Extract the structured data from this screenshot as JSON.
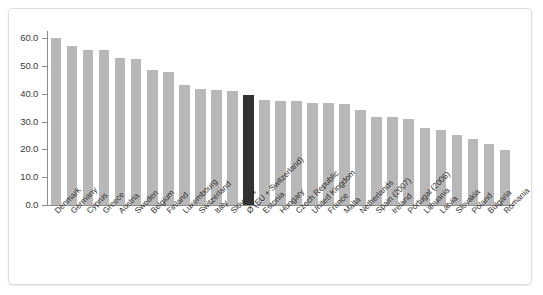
{
  "chart_data": {
    "type": "bar",
    "title": "",
    "subtitle": "",
    "xlabel": "",
    "ylabel": "",
    "ylim": [
      0,
      60
    ],
    "ytick_labels": [
      "60.0",
      "50.0",
      "40.0",
      "30.0",
      "20.0",
      "10.0",
      "0.0"
    ],
    "ytick_values": [
      60,
      50,
      40,
      30,
      20,
      10,
      0
    ],
    "grid": false,
    "legend": null,
    "legend_position": "none",
    "bar_color": "#b8b8b8",
    "highlight_color": "#333333",
    "highlight_category": "Ø (EU + Switzerland)",
    "categories": [
      "Denmark",
      "Germany",
      "Cyprus",
      "Greece",
      "Austria",
      "Sweden",
      "Belgium",
      "Finland",
      "Luxembourg",
      "Switzerland",
      "Italy",
      "Slovenia",
      "Ø (EU + Switzerland)",
      "Estonia",
      "Hungary",
      "Czech Republic",
      "United Kingdom",
      "France",
      "Malta",
      "Netherlands",
      "Spain (2007)",
      "Ireland",
      "Portugal (2006)",
      "Lithuania",
      "Latvia",
      "Slovakia",
      "Poland",
      "Bulgaria",
      "Romania"
    ],
    "values": [
      60.0,
      57.2,
      55.8,
      55.6,
      52.8,
      52.5,
      48.4,
      47.8,
      43.0,
      41.8,
      41.3,
      41.0,
      39.4,
      37.8,
      37.5,
      37.2,
      36.8,
      36.5,
      36.2,
      34.0,
      31.8,
      31.5,
      30.8,
      27.5,
      26.8,
      25.0,
      23.8,
      22.0,
      19.8
    ]
  }
}
